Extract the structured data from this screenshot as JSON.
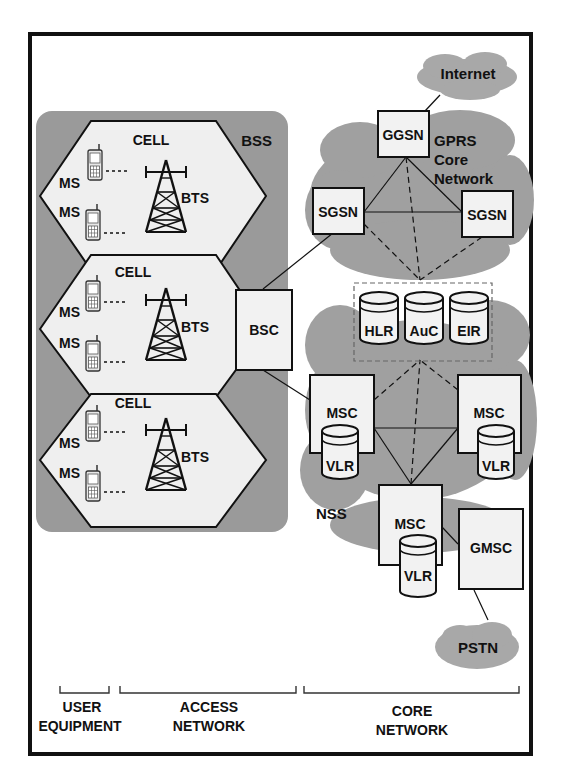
{
  "figure": {
    "regions": {
      "bss": "BSS",
      "gprs_core": [
        "GPRS",
        "Core",
        "Network"
      ],
      "nss": "NSS",
      "internet": "Internet",
      "pstn": "PSTN"
    },
    "cells": [
      {
        "label": "CELL",
        "ms": [
          "MS",
          "MS"
        ],
        "bts": "BTS"
      },
      {
        "label": "CELL",
        "ms": [
          "MS",
          "MS"
        ],
        "bts": "BTS"
      },
      {
        "label": "CELL",
        "ms": [
          "MS",
          "MS"
        ],
        "bts": "BTS"
      }
    ],
    "nodes": {
      "bsc": "BSC",
      "ggsn": "GGSN",
      "sgsn_left": "SGSN",
      "sgsn_right": "SGSN",
      "hlr": "HLR",
      "auc": "AuC",
      "eir": "EIR",
      "msc_left": "MSC",
      "msc_right": "MSC",
      "msc_bottom": "MSC",
      "vlr_left": "VLR",
      "vlr_right": "VLR",
      "vlr_bottom": "VLR",
      "gmsc": "GMSC"
    },
    "brackets": {
      "user_equipment": [
        "USER",
        "EQUIPMENT"
      ],
      "access_network": [
        "ACCESS",
        "NETWORK"
      ],
      "core_network": [
        "CORE",
        "NETWORK"
      ]
    },
    "colors": {
      "region_fill": "#9a9a9a",
      "cell_fill": "#efefef",
      "node_fill": "#f2f2f2",
      "stroke": "#111111"
    }
  }
}
